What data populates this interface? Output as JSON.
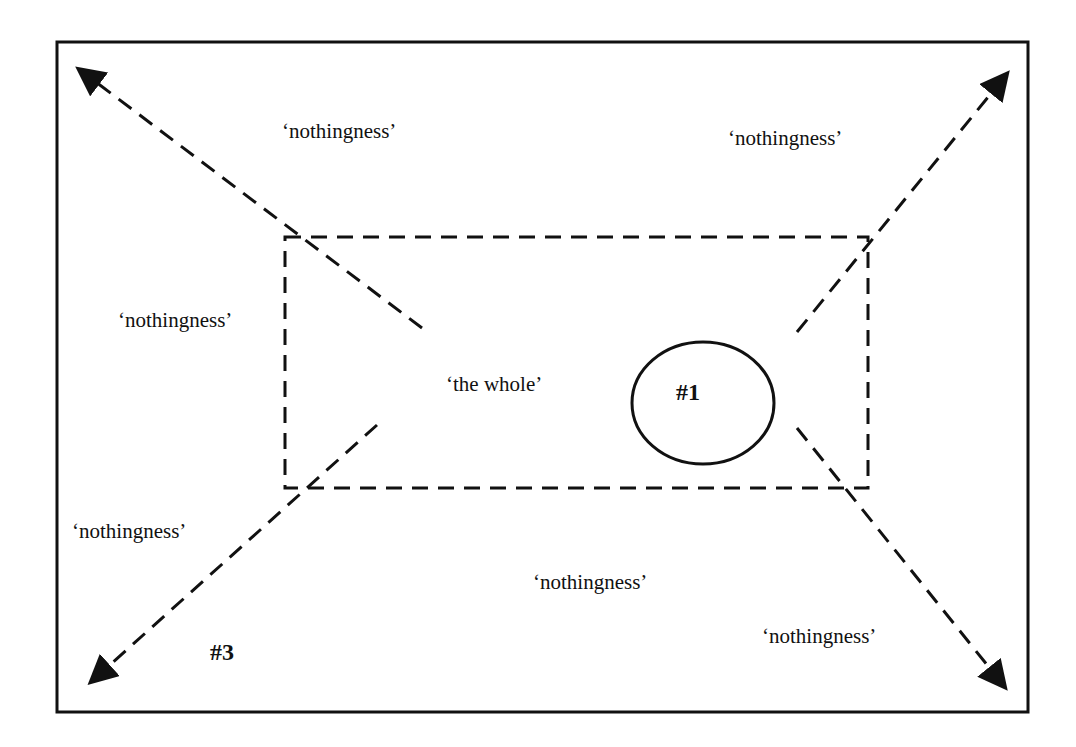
{
  "diagram": {
    "frame": {
      "x1": 57,
      "y1": 42,
      "x2": 1028,
      "y2": 712
    },
    "whole_box": {
      "label": "‘the whole’",
      "x1": 285,
      "y1": 237,
      "x2": 868,
      "y2": 488
    },
    "circle": {
      "label": "#1",
      "cx": 703,
      "cy": 403,
      "rx": 71,
      "ry": 61
    },
    "labels": [
      {
        "id": "nothingness-top-left",
        "text": "‘nothingness’",
        "x": 282,
        "y": 121
      },
      {
        "id": "nothingness-top-right",
        "text": "‘nothingness’",
        "x": 728,
        "y": 128
      },
      {
        "id": "nothingness-mid-left",
        "text": "‘nothingness’",
        "x": 118,
        "y": 310
      },
      {
        "id": "nothingness-low-left",
        "text": "‘nothingness’",
        "x": 72,
        "y": 521
      },
      {
        "id": "nothingness-bottom-center",
        "text": "‘nothingness’",
        "x": 533,
        "y": 572
      },
      {
        "id": "nothingness-bottom-right",
        "text": "‘nothingness’",
        "x": 762,
        "y": 626
      }
    ],
    "the_whole_label": {
      "text": "‘the whole’",
      "x": 446,
      "y": 374
    },
    "marker_1": {
      "text": "#1",
      "x": 676,
      "y": 380
    },
    "marker_3": {
      "text": "#3",
      "x": 210,
      "y": 640
    },
    "arrows": [
      {
        "id": "arrow-top-left",
        "from": [
          422,
          328
        ],
        "to": [
          80,
          70
        ]
      },
      {
        "id": "arrow-top-right",
        "from": [
          797,
          332
        ],
        "to": [
          1006,
          75
        ]
      },
      {
        "id": "arrow-bottom-left",
        "from": [
          377,
          425
        ],
        "to": [
          92,
          681
        ]
      },
      {
        "id": "arrow-bottom-right",
        "from": [
          797,
          428
        ],
        "to": [
          1004,
          686
        ]
      }
    ],
    "colors": {
      "line": "#111111",
      "background": "#ffffff"
    }
  }
}
